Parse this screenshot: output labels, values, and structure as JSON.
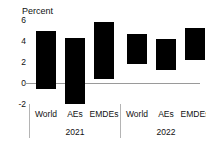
{
  "chart_data": {
    "type": "bar",
    "title": "",
    "subtitle": "",
    "xlabel": "",
    "ylabel": "Percent",
    "ylim": [
      -2,
      6
    ],
    "yticks": [
      -2,
      0,
      2,
      4,
      6
    ],
    "ytick_labels": [
      "-2",
      "0",
      "2",
      "4",
      "6"
    ],
    "grid": false,
    "legend": "none",
    "note": "Floating range bars: each bar spans from a low value to a high value.",
    "categories": [
      "World",
      "AEs",
      "EMDEs",
      "World",
      "AEs",
      "EMDEs"
    ],
    "groups": [
      "2021",
      "2022"
    ],
    "group_spans": [
      [
        0,
        2
      ],
      [
        3,
        5
      ]
    ],
    "bars": [
      {
        "group": "2021",
        "category": "World",
        "low": -0.6,
        "high": 4.95
      },
      {
        "group": "2021",
        "category": "AEs",
        "low": -2.0,
        "high": 4.25
      },
      {
        "group": "2021",
        "category": "EMDEs",
        "low": 0.4,
        "high": 5.8
      },
      {
        "group": "2022",
        "category": "World",
        "low": 1.8,
        "high": 4.65
      },
      {
        "group": "2022",
        "category": "AEs",
        "low": 1.25,
        "high": 4.2
      },
      {
        "group": "2022",
        "category": "EMDEs",
        "low": 2.2,
        "high": 5.2
      }
    ],
    "series": [
      {
        "name": "low",
        "values": [
          -0.6,
          -2.0,
          0.4,
          1.8,
          1.25,
          2.2
        ]
      },
      {
        "name": "high",
        "values": [
          4.95,
          4.25,
          5.8,
          4.65,
          4.2,
          5.2
        ]
      }
    ],
    "colors": {
      "bar": "#000000",
      "axis": "#9a9a9a",
      "separator": "#b4b4b4",
      "text": "#111111",
      "background": "#ffffff"
    }
  },
  "axis": {
    "title": "Percent"
  },
  "labels": {
    "categories": [
      "World",
      "AEs",
      "EMDEs",
      "World",
      "AEs",
      "EMDEs"
    ],
    "groups": [
      "2021",
      "2022"
    ]
  }
}
